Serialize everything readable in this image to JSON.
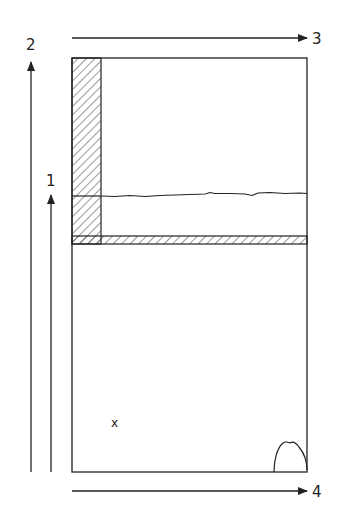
{
  "diagram": {
    "labels": {
      "arrow_1": "1",
      "arrow_2": "2",
      "arrow_3": "3",
      "arrow_4": "4",
      "point_marker": "x"
    },
    "colors": {
      "stroke": "#222222",
      "background": "#ffffff"
    }
  }
}
